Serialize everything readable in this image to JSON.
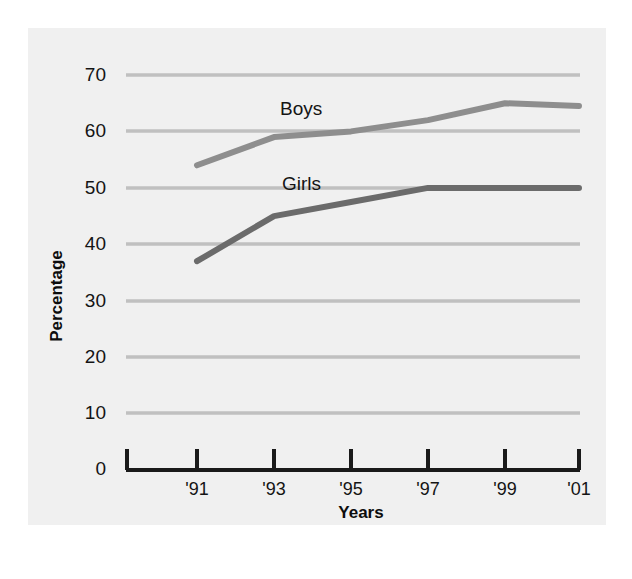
{
  "figure": {
    "background_color": "#f0f0f0",
    "page_color": "#ffffff",
    "gridline_color": "#c0c0c0",
    "axis_color": "#1a1a1a"
  },
  "axis_titles": {
    "y": "Percentage",
    "x": "Years"
  },
  "chart_data": {
    "type": "line",
    "title": "",
    "subtitle": "",
    "xlabel": "Years",
    "ylabel": "Percentage",
    "categories": [
      "'91",
      "'93",
      "'95",
      "'97",
      "'99",
      "'01"
    ],
    "x": [
      "'91",
      "'93",
      "'95",
      "'97",
      "'99",
      "'01"
    ],
    "ylim": [
      0,
      70
    ],
    "ytick_labels": [
      "0",
      "10",
      "20",
      "30",
      "40",
      "50",
      "60",
      "70"
    ],
    "ytick_values": [
      0,
      10,
      20,
      30,
      40,
      50,
      60,
      70
    ],
    "xtick_labels": [
      "'91",
      "'93",
      "'95",
      "'97",
      "'99",
      "'01"
    ],
    "grid": "horizontal",
    "legend_position": "inline-annotations",
    "series": [
      {
        "name": "Boys",
        "color": "#8e8e8e",
        "values": [
          54,
          59,
          60,
          62,
          65,
          64.5
        ],
        "label_text": "Boys"
      },
      {
        "name": "Girls",
        "color": "#6b6b6b",
        "values": [
          37,
          45,
          47.5,
          50,
          50,
          50
        ],
        "label_text": "Girls"
      }
    ],
    "annotations": [
      {
        "text": "Boys",
        "series": "Boys"
      },
      {
        "text": "Girls",
        "series": "Girls"
      }
    ]
  }
}
